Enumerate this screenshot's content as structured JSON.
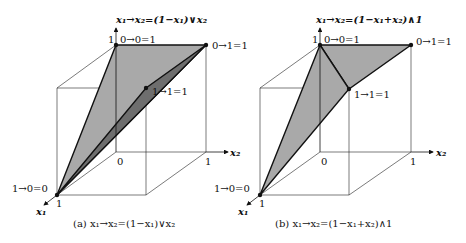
{
  "panels": [
    {
      "id": "a",
      "axis_title": "x₁→x₂=(1−x₁)∨x₂",
      "caption": "(a) x₁→x₂=(1−x₁)∨x₂",
      "labels": {
        "top_one": "1",
        "v001": "0→0=1",
        "v011": "0→1=1",
        "v111": "1→1=1",
        "v100": "1→0=0",
        "origin": "0",
        "x2_one": "1",
        "x1_one": "1",
        "x2_axis": "x₂",
        "x1_axis": "x₁"
      }
    },
    {
      "id": "b",
      "axis_title": "x₁→x₂=(1−x₁+x₂)∧1",
      "caption": "(b) x₁→x₂=(1−x₁+x₂)∧1",
      "labels": {
        "top_one": "1",
        "v001": "0→0=1",
        "v011": "0→1=1",
        "v111": "1→1=1",
        "v100": "1→0=0",
        "origin": "0",
        "x2_one": "1",
        "x1_one": "1",
        "x2_axis": "x₂",
        "x1_axis": "x₁"
      }
    }
  ],
  "colors": {
    "surface_light": "#a9a9a9",
    "surface_dark": "#6e6e6e",
    "line": "#111111"
  }
}
